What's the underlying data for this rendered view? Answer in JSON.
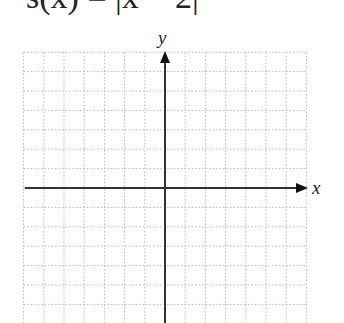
{
  "title": "s(x) = |x − 2|",
  "graph": {
    "x_axis_label": "x",
    "y_axis_label": "y",
    "x_range": [
      -7,
      7
    ],
    "y_range": [
      -7,
      7
    ],
    "grid_step": 1,
    "grid_style": "dotted",
    "colors": {
      "grid": "#b5b5b5",
      "axis": "#333333",
      "text": "#222222"
    }
  },
  "chart_data": {
    "type": "line",
    "title": "s(x) = |x − 2|",
    "xlabel": "x",
    "ylabel": "y",
    "xlim": [
      -7,
      7
    ],
    "ylim": [
      -7,
      7
    ],
    "grid": true,
    "series": []
  }
}
